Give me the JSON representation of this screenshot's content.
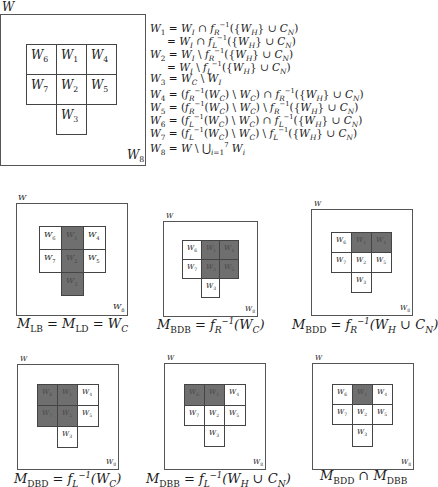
{
  "main_diagram": {
    "outer_label": "W",
    "background_label": "W8",
    "cells": [
      {
        "id": "W6",
        "row": 0,
        "col": 0
      },
      {
        "id": "W1",
        "row": 0,
        "col": 1
      },
      {
        "id": "W4",
        "row": 0,
        "col": 2
      },
      {
        "id": "W7",
        "row": 1,
        "col": 0
      },
      {
        "id": "W2",
        "row": 1,
        "col": 1
      },
      {
        "id": "W5",
        "row": 1,
        "col": 2
      },
      {
        "id": "W3",
        "row": 2,
        "col": 1
      }
    ]
  },
  "equations": [
    "W1 = W_I ∩ f_R^{-1}({W_H} ∪ C_N)",
    "= W_I ∩ f_L^{-1}({W_H} ∪ C_N)",
    "W2 = W_I \\ f_R^{-1}({W_H} ∪ C_N)",
    "= W_I \\ f_L^{-1}({W_H} ∪ C_N)",
    "W3 = W_C \\ W_I",
    "W4 = (f_R^{-1}(W_C) \\ W_C) ∩ f_R^{-1}({W_H} ∪ C_N)",
    "W5 = (f_R^{-1}(W_C) \\ W_C) \\ f_R^{-1}({W_H} ∪ C_N)",
    "W6 = (f_L^{-1}(W_C) \\ W_C) ∩ f_L^{-1}({W_H} ∪ C_N)",
    "W7 = (f_L^{-1}(W_C) \\ W_C) \\ f_L^{-1}({W_H} ∪ C_N)",
    "W8 = W \\ ⋃_{i=1}^{7} W_i"
  ],
  "panels": [
    {
      "caption": "M_LB = M_LD = W_C",
      "shaded": [
        "W1",
        "W2",
        "W3"
      ]
    },
    {
      "caption": "M_BDB = f_R^{-1}(W_C)",
      "shaded": [
        "W1",
        "W4",
        "W2",
        "W5"
      ]
    },
    {
      "caption": "M_BDD = f_R^{-1}(W_H ∪ C_N)",
      "shaded": [
        "W1",
        "W4"
      ]
    },
    {
      "caption": "M_DBD = f_L^{-1}(W_C)",
      "shaded": [
        "W6",
        "W1",
        "W7",
        "W2"
      ]
    },
    {
      "caption": "M_DBB = f_L^{-1}(W_H ∪ C_N)",
      "shaded": [
        "W6",
        "W1"
      ]
    },
    {
      "caption": "M_BDD ∩ M_DBB",
      "shaded": [
        "W1"
      ]
    }
  ],
  "colors": {
    "shaded": "#6f6f6f",
    "border": "#444444"
  }
}
